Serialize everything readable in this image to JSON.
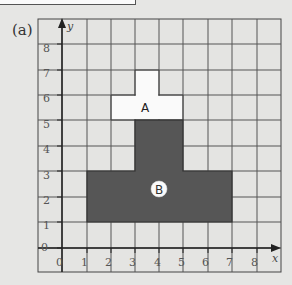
{
  "figure": {
    "label": "(a)",
    "x_axis": {
      "name": "x",
      "ticks": [
        "0",
        "1",
        "2",
        "3",
        "4",
        "5",
        "6",
        "7",
        "8"
      ]
    },
    "y_axis": {
      "name": "y",
      "ticks": [
        "0",
        "1",
        "2",
        "3",
        "4",
        "5",
        "6",
        "7",
        "8"
      ]
    },
    "grid": {
      "x_min": -1,
      "x_max": 9,
      "y_min": -1,
      "y_max": 9
    },
    "shapes": [
      {
        "name": "A",
        "color": "#fafafa",
        "cells": "T-shape: stub x 3–4, y 6–7; bar x 2–5, y 5–6"
      },
      {
        "name": "B",
        "color": "#555555",
        "cells": "T-shape: stem x 3–5, y 3–5; base x 1–7, y 1–3"
      }
    ]
  },
  "colors": {
    "background": "#e6e6e4",
    "grid": "#444444",
    "shape_a": "#fafafa",
    "shape_b": "#565656"
  }
}
